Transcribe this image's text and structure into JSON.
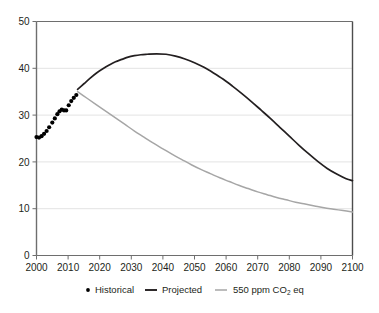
{
  "chart_data": {
    "type": "line",
    "title": "",
    "subtitle": "",
    "xlabel": "",
    "ylabel": "",
    "xlim": [
      2000,
      2100
    ],
    "ylim": [
      0,
      50
    ],
    "grid": true,
    "grid_axis": "y",
    "legend_position": "bottom",
    "x_ticks": [
      "2000",
      "2010",
      "2020",
      "2030",
      "2040",
      "2050",
      "2060",
      "2070",
      "2080",
      "2090",
      "2100"
    ],
    "y_ticks": [
      "0",
      "10",
      "20",
      "30",
      "40",
      "50"
    ],
    "legend": [
      {
        "label": "Historical",
        "marker": "dot",
        "color": "#000000"
      },
      {
        "label": "Projected",
        "marker": "line",
        "color": "#231f20"
      },
      {
        "label": "550 ppm CO",
        "label_sub": "2",
        "label_tail": " eq",
        "marker": "line",
        "color": "#a6a6a6"
      }
    ],
    "series": [
      {
        "name": "Historical",
        "type": "scatter",
        "color": "#000000",
        "points": [
          [
            2000.0,
            25.3
          ],
          [
            2000.8,
            25.2
          ],
          [
            2001.6,
            25.5
          ],
          [
            2002.4,
            26.0
          ],
          [
            2003.2,
            26.6
          ],
          [
            2004.0,
            27.4
          ],
          [
            2005.0,
            28.4
          ],
          [
            2005.8,
            29.3
          ],
          [
            2006.6,
            30.2
          ],
          [
            2007.3,
            30.8
          ],
          [
            2008.0,
            31.2
          ],
          [
            2008.7,
            31.0
          ],
          [
            2009.4,
            31.0
          ],
          [
            2010.2,
            32.1
          ],
          [
            2011.0,
            33.0
          ],
          [
            2011.8,
            33.7
          ],
          [
            2012.6,
            34.3
          ]
        ]
      },
      {
        "name": "Projected",
        "type": "line",
        "color": "#231f20",
        "points": [
          [
            2013.0,
            35.5
          ],
          [
            2015.0,
            36.7
          ],
          [
            2017.0,
            37.9
          ],
          [
            2019.0,
            39.0
          ],
          [
            2021.0,
            39.9
          ],
          [
            2023.0,
            40.7
          ],
          [
            2025.0,
            41.4
          ],
          [
            2027.0,
            41.9
          ],
          [
            2029.0,
            42.4
          ],
          [
            2031.0,
            42.7
          ],
          [
            2033.0,
            42.9
          ],
          [
            2035.0,
            43.0
          ],
          [
            2038.0,
            43.1
          ],
          [
            2041.0,
            43.0
          ],
          [
            2044.0,
            42.6
          ],
          [
            2047.0,
            42.0
          ],
          [
            2050.0,
            41.2
          ],
          [
            2053.0,
            40.2
          ],
          [
            2056.0,
            39.0
          ],
          [
            2059.0,
            37.7
          ],
          [
            2062.0,
            36.2
          ],
          [
            2065.0,
            34.6
          ],
          [
            2068.0,
            32.9
          ],
          [
            2071.0,
            31.1
          ],
          [
            2074.0,
            29.3
          ],
          [
            2077.0,
            27.4
          ],
          [
            2080.0,
            25.5
          ],
          [
            2083.0,
            23.6
          ],
          [
            2086.0,
            21.8
          ],
          [
            2089.0,
            20.1
          ],
          [
            2092.0,
            18.6
          ],
          [
            2095.0,
            17.4
          ],
          [
            2098.0,
            16.4
          ],
          [
            2100.0,
            16.0
          ]
        ]
      },
      {
        "name": "550 ppm CO2 eq",
        "type": "line",
        "color": "#a6a6a6",
        "points": [
          [
            2013.0,
            35.0
          ],
          [
            2016.0,
            33.6
          ],
          [
            2019.0,
            32.2
          ],
          [
            2022.0,
            30.8
          ],
          [
            2025.0,
            29.4
          ],
          [
            2028.0,
            28.0
          ],
          [
            2031.0,
            26.6
          ],
          [
            2034.0,
            25.3
          ],
          [
            2037.0,
            24.0
          ],
          [
            2040.0,
            22.8
          ],
          [
            2043.0,
            21.6
          ],
          [
            2046.0,
            20.5
          ],
          [
            2049.0,
            19.4
          ],
          [
            2052.0,
            18.4
          ],
          [
            2055.0,
            17.5
          ],
          [
            2058.0,
            16.6
          ],
          [
            2061.0,
            15.8
          ],
          [
            2064.0,
            15.0
          ],
          [
            2067.0,
            14.3
          ],
          [
            2070.0,
            13.6
          ],
          [
            2073.0,
            13.0
          ],
          [
            2076.0,
            12.4
          ],
          [
            2079.0,
            11.9
          ],
          [
            2082.0,
            11.4
          ],
          [
            2085.0,
            11.0
          ],
          [
            2088.0,
            10.6
          ],
          [
            2091.0,
            10.2
          ],
          [
            2094.0,
            9.9
          ],
          [
            2097.0,
            9.6
          ],
          [
            2100.0,
            9.3
          ]
        ]
      }
    ]
  },
  "colors": {
    "historical": "#000000",
    "projected": "#231f20",
    "target": "#a6a6a6",
    "axis": "#6e6e6e",
    "grid": "#e3e3e3",
    "text": "#231f20",
    "background": "#ffffff"
  }
}
